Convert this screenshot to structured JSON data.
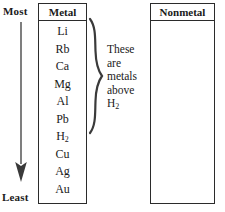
{
  "diagram": {
    "scale": {
      "top_label": "Most",
      "bottom_label": "Least",
      "arrow_icon": "down-arrow-icon"
    },
    "columns": [
      {
        "key": "metal",
        "header": "Metal",
        "items": [
          "Li",
          "Rb",
          "Ca",
          "Mg",
          "Al",
          "Pb",
          "H",
          "Cu",
          "Ag",
          "Au"
        ],
        "item_subscripts": [
          "",
          "",
          "",
          "",
          "",
          "",
          "2",
          "",
          "",
          ""
        ]
      },
      {
        "key": "nonmetal",
        "header": "Nonmetal",
        "items": []
      }
    ],
    "annotation": {
      "brace_icon": "right-curly-brace-icon",
      "lines": [
        "These",
        "are",
        "metals",
        "above",
        "H"
      ],
      "last_line_subscript": "2"
    },
    "colors": {
      "ink": "#1a1a1a",
      "rule": "#2b2b2b",
      "background": "#ffffff"
    }
  }
}
